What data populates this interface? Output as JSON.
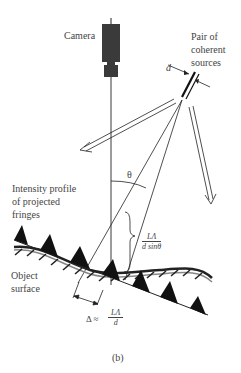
{
  "labels": {
    "camera": "Camera",
    "sources_line1": "Pair of",
    "sources_line2": "coherent",
    "sources_line3": "sources",
    "d": "d",
    "theta": "θ",
    "intensity_line1": "Intensity profile",
    "intensity_line2": "of projected",
    "intensity_line3": "fringes",
    "object_line1": "Object",
    "object_line2": "surface",
    "fringe_spacing_num": "LΛ",
    "fringe_spacing_den": "d sinθ",
    "delta_prefix": "Δ ≈",
    "delta_num": "LΛ",
    "delta_den": "d",
    "caption": "(b)"
  },
  "colors": {
    "ink": "#222222",
    "camera_body": "#3a3a3a",
    "text": "#444444"
  }
}
